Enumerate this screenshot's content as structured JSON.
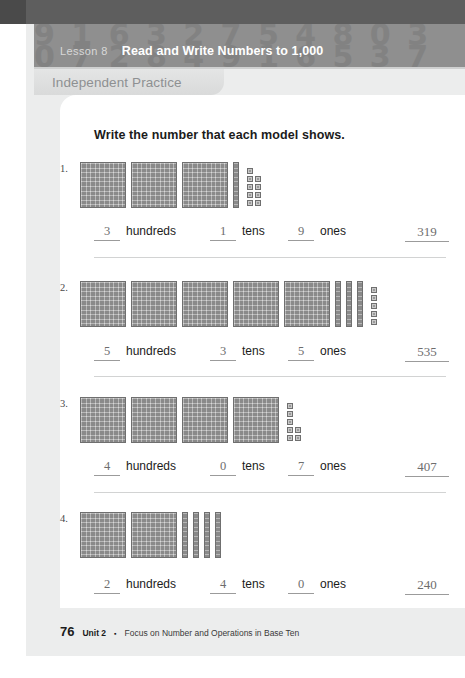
{
  "header": {
    "lesson_label": "Lesson 8",
    "lesson_title": "Read and Write Numbers to 1,000",
    "pattern_rows": [
      "9 1 6 3 2 7 5 4 8 0 3",
      "0 7 2 8 4 9 1 6 5 3 7",
      "5 3 9 0 6 1 8 2 7 4 9"
    ]
  },
  "tab": {
    "label": "Independent Practice"
  },
  "prompt": "Write the number that each model shows.",
  "labels": {
    "hundreds": "hundreds",
    "tens": "tens",
    "ones": "ones"
  },
  "problems": [
    {
      "number": "1.",
      "flats": 3,
      "rods": 1,
      "ones": 9,
      "ones_layout": [
        1,
        2,
        2,
        2,
        2
      ],
      "hundreds_answer": "3",
      "tens_answer": "1",
      "ones_answer": "9",
      "total_answer": "319"
    },
    {
      "number": "2.",
      "flats": 5,
      "rods": 3,
      "ones": 5,
      "ones_layout": [
        1,
        1,
        1,
        1,
        1
      ],
      "hundreds_answer": "5",
      "tens_answer": "3",
      "ones_answer": "5",
      "total_answer": "535"
    },
    {
      "number": "3.",
      "flats": 4,
      "rods": 0,
      "ones": 7,
      "ones_layout": [
        1,
        1,
        1,
        2,
        2
      ],
      "hundreds_answer": "4",
      "tens_answer": "0",
      "ones_answer": "7",
      "total_answer": "407"
    },
    {
      "number": "4.",
      "flats": 2,
      "rods": 4,
      "ones": 0,
      "ones_layout": [],
      "hundreds_answer": "2",
      "tens_answer": "4",
      "ones_answer": "0",
      "total_answer": "240"
    }
  ],
  "footer": {
    "page_number": "76",
    "unit": "Unit 2",
    "separator": "▪",
    "description": "Focus on Number and Operations in Base Ten"
  },
  "colors": {
    "header_bar": "#8f8f8f",
    "sheet_background": "#eceded",
    "block_fill": "#8a8a8a",
    "blank_ink": "#6d6d6d"
  }
}
